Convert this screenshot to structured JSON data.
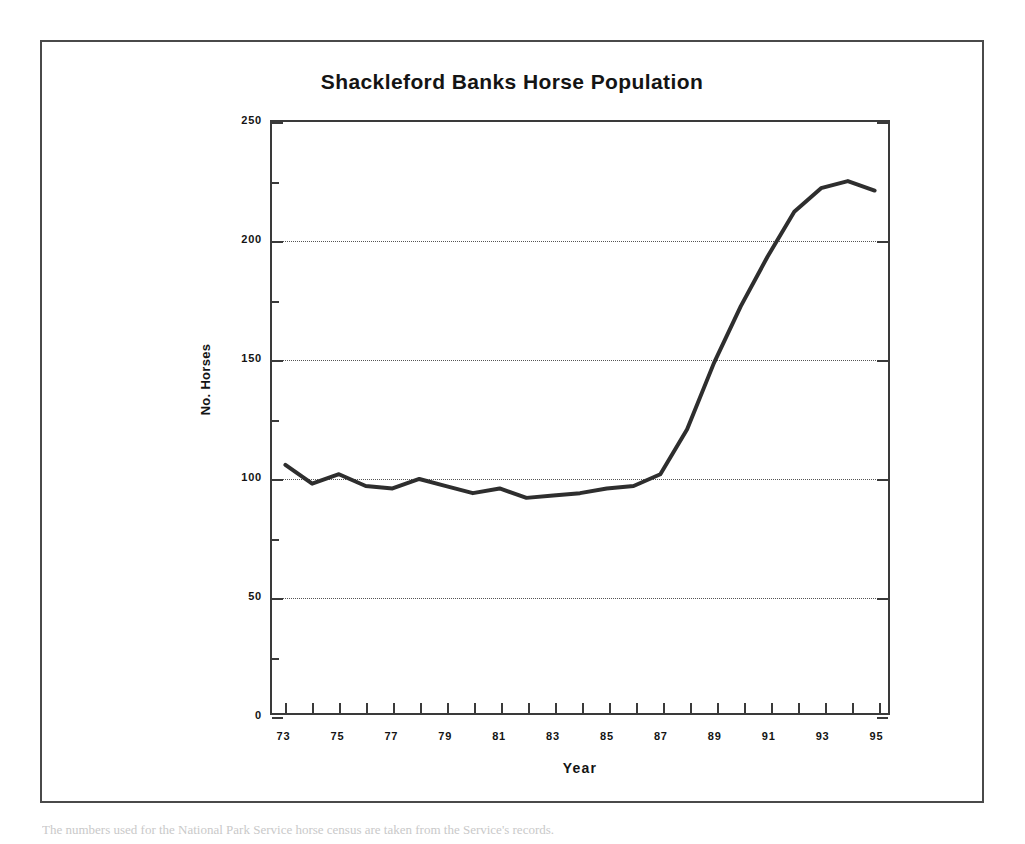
{
  "caption": {
    "text": "The numbers used for the National Park Service horse census are taken from the Service's records."
  },
  "chart_data": {
    "type": "line",
    "title": "Shackleford Banks Horse Population",
    "xlabel": "Year",
    "ylabel": "No. Horses",
    "xlim": [
      72.5,
      95.5
    ],
    "ylim": [
      0,
      250
    ],
    "ytick_values": [
      0,
      50,
      100,
      150,
      200,
      250
    ],
    "ytick_labels": [
      "0",
      "50",
      "100",
      "150",
      "200",
      "250"
    ],
    "yminor_step": 25,
    "gridlines_y": [
      50,
      100,
      150,
      200
    ],
    "grid": "horizontal-dotted",
    "legend": "none",
    "xtick_all": [
      73,
      74,
      75,
      76,
      77,
      78,
      79,
      80,
      81,
      82,
      83,
      84,
      85,
      86,
      87,
      88,
      89,
      90,
      91,
      92,
      93,
      94,
      95
    ],
    "xtick_labeled": [
      73,
      75,
      77,
      79,
      81,
      83,
      85,
      87,
      89,
      91,
      93,
      95
    ],
    "xtick_labels": [
      "73",
      "75",
      "77",
      "79",
      "81",
      "83",
      "85",
      "87",
      "89",
      "91",
      "93",
      "95"
    ],
    "line_color": "#2e2e2e",
    "line_width": 4,
    "x": [
      73,
      74,
      75,
      76,
      77,
      78,
      79,
      80,
      81,
      82,
      83,
      84,
      85,
      86,
      87,
      88,
      89,
      90,
      91,
      92,
      93,
      94,
      95
    ],
    "values": [
      105,
      97,
      101,
      96,
      95,
      99,
      96,
      93,
      95,
      91,
      92,
      93,
      95,
      96,
      101,
      120,
      148,
      172,
      193,
      212,
      222,
      225,
      221
    ],
    "series": [
      {
        "name": "Shackleford Banks horses",
        "values": [
          105,
          97,
          101,
          96,
          95,
          99,
          96,
          93,
          95,
          91,
          92,
          93,
          95,
          96,
          101,
          120,
          148,
          172,
          193,
          212,
          222,
          225,
          221
        ]
      }
    ]
  }
}
